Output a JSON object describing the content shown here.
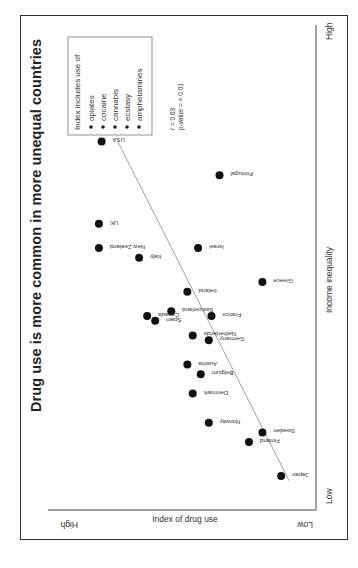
{
  "chart_data": {
    "type": "scatter",
    "title": "Drug use is more common in more unequal countries",
    "xlabel": "Income inequality",
    "ylabel": "Index of drug use",
    "x_ticks": {
      "low": "Low",
      "high": "High"
    },
    "y_ticks": {
      "low": "Low",
      "high": "High"
    },
    "xlim": [
      0,
      100
    ],
    "ylim": [
      0,
      100
    ],
    "grid": false,
    "legend": {
      "title": "Index includes use of",
      "items": [
        "opiates",
        "cocaine",
        "cannabis",
        "ecstasy",
        "amphetamines"
      ],
      "position": "top-right"
    },
    "stats": {
      "r": "r = 0.63",
      "p": "p-value = < 0.01"
    },
    "trendline": {
      "x0": 6,
      "y0": 10,
      "x1": 76,
      "y1": 74
    },
    "points": [
      {
        "country": "USA",
        "x": 76,
        "y": 80
      },
      {
        "country": "UK",
        "x": 59,
        "y": 81
      },
      {
        "country": "New Zealand",
        "x": 54,
        "y": 81
      },
      {
        "country": "Italy",
        "x": 52,
        "y": 66
      },
      {
        "country": "Portugal",
        "x": 69,
        "y": 36
      },
      {
        "country": "Israel",
        "x": 54,
        "y": 44
      },
      {
        "country": "Greece",
        "x": 47,
        "y": 20
      },
      {
        "country": "Ireland",
        "x": 45,
        "y": 48
      },
      {
        "country": "Switzerland",
        "x": 41,
        "y": 54
      },
      {
        "country": "Canada",
        "x": 40,
        "y": 63
      },
      {
        "country": "Spain",
        "x": 39,
        "y": 60
      },
      {
        "country": "France",
        "x": 40,
        "y": 39
      },
      {
        "country": "Netherlands",
        "x": 36,
        "y": 46
      },
      {
        "country": "Germany",
        "x": 35,
        "y": 40
      },
      {
        "country": "Austria",
        "x": 30,
        "y": 48
      },
      {
        "country": "Belgium",
        "x": 28,
        "y": 43
      },
      {
        "country": "Denmark",
        "x": 24,
        "y": 46
      },
      {
        "country": "Norway",
        "x": 18,
        "y": 40
      },
      {
        "country": "Sweden",
        "x": 16,
        "y": 20
      },
      {
        "country": "Finland",
        "x": 14,
        "y": 25
      },
      {
        "country": "Japan",
        "x": 7,
        "y": 13
      }
    ]
  },
  "layout": {
    "dot_color": "#111111",
    "line_color": "#888888",
    "frame_color": "#333333"
  }
}
